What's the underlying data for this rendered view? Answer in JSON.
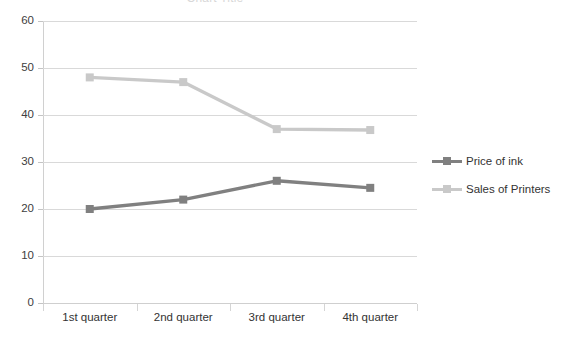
{
  "chart_data": {
    "type": "line",
    "title": "",
    "xlabel": "",
    "ylabel": "",
    "categories": [
      "1st quarter",
      "2nd quarter",
      "3rd quarter",
      "4th quarter"
    ],
    "series": [
      {
        "name": "Price of ink",
        "values": [
          20,
          22,
          26,
          24.5
        ],
        "color": "#808080"
      },
      {
        "name": "Sales of Printers",
        "values": [
          48,
          47,
          37,
          36.8
        ],
        "color": "#c9c9c9"
      }
    ],
    "ylim": [
      0,
      60
    ],
    "yticks": [
      0,
      10,
      20,
      30,
      40,
      50,
      60
    ],
    "ytick_labels": [
      "0",
      "10",
      "20",
      "30",
      "40",
      "50",
      "60"
    ],
    "grid": true,
    "legend_position": "right",
    "marker": "square"
  },
  "legend": {
    "items": [
      {
        "label": "Price of ink",
        "color": "#808080"
      },
      {
        "label": "Sales of Printers",
        "color": "#c9c9c9"
      }
    ]
  },
  "title_sliver": "Chart Title"
}
